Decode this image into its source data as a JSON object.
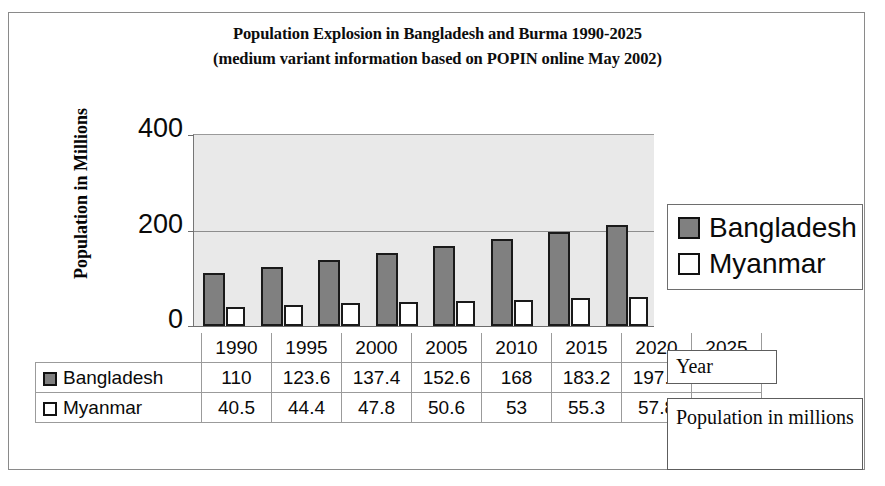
{
  "chart_data": {
    "type": "bar",
    "title": "Population Explosion in Bangladesh and Burma 1990-2025",
    "subtitle": "(medium variant information based on POPIN online May 2002)",
    "xlabel": "Year",
    "ylabel": "Population in Millions",
    "categories": [
      "1990",
      "1995",
      "2000",
      "2005",
      "2010",
      "2015",
      "2020",
      "2025"
    ],
    "series": [
      {
        "name": "Bangladesh",
        "color": "#808080",
        "swatch": "filled",
        "values": [
          110,
          123.6,
          137.4,
          152.6,
          168,
          183.2,
          197.6,
          211
        ],
        "labels": [
          "110",
          "123.6",
          "137.4",
          "152.6",
          "168",
          "183.2",
          "197.6",
          "211"
        ]
      },
      {
        "name": "Myanmar",
        "color": "#ffffff",
        "swatch": "empty",
        "values": [
          40.5,
          44.4,
          47.8,
          50.6,
          53,
          55.3,
          57.8,
          60.2
        ],
        "labels": [
          "40.5",
          "44.4",
          "47.8",
          "50.6",
          "53",
          "55.3",
          "57.8",
          "60.2"
        ]
      }
    ],
    "ylim": [
      0,
      400
    ],
    "yticks": [
      0,
      200,
      400
    ],
    "ytick_labels": [
      "0",
      "200",
      "400"
    ],
    "grid": true,
    "legend_position": "right",
    "plot_background": "#e9e9e9",
    "data_table_visible": true
  },
  "annotations": {
    "year_callout": "Year",
    "population_callout": "Population in millions"
  }
}
